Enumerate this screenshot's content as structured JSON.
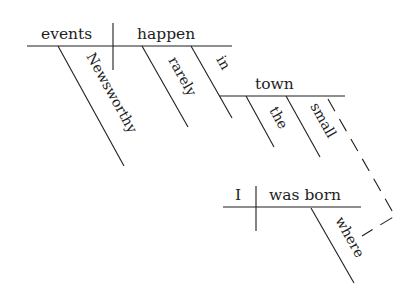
{
  "diagram": {
    "type": "sentence-diagram",
    "sentence": "Newsworthy events rarely happen in the small town where I was born.",
    "main_clause": {
      "subject": "events",
      "verb": "happen",
      "subject_modifiers": [
        "Newsworthy"
      ],
      "verb_modifiers": [
        "rarely",
        "in"
      ]
    },
    "prepositional_phrase": {
      "preposition": "in",
      "object": "town",
      "object_modifiers": [
        "the",
        "small"
      ]
    },
    "relative_clause": {
      "subject": "I",
      "verb": "was born",
      "verb_modifiers": [
        "where"
      ]
    }
  }
}
